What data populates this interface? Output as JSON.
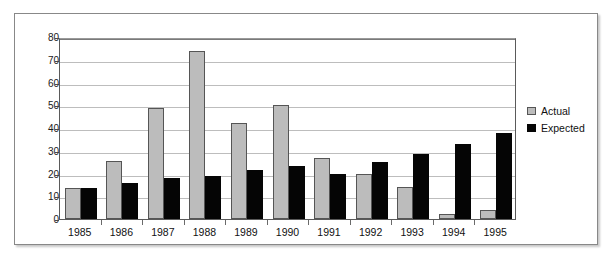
{
  "chart_data": {
    "type": "bar",
    "title": "",
    "xlabel": "",
    "ylabel": "",
    "ylim": [
      0,
      80
    ],
    "yticks": [
      0,
      10,
      20,
      30,
      40,
      50,
      60,
      70,
      80
    ],
    "grid": true,
    "legend_position": "right",
    "categories": [
      "1985",
      "1986",
      "1987",
      "1988",
      "1989",
      "1990",
      "1991",
      "1992",
      "1993",
      "1994",
      "1995"
    ],
    "series": [
      {
        "name": "Actual",
        "color": "#bcbcbc",
        "values": [
          13.5,
          25.5,
          49,
          74,
          42,
          50,
          27,
          20,
          14,
          2,
          4
        ]
      },
      {
        "name": "Expected",
        "color": "#050505",
        "values": [
          13.5,
          16,
          18,
          19,
          21.5,
          23.5,
          20,
          25,
          28.5,
          33,
          38
        ]
      }
    ]
  },
  "legend": {
    "items": [
      {
        "label": "Actual",
        "swatch": "actual"
      },
      {
        "label": "Expected",
        "swatch": "expected"
      }
    ]
  }
}
